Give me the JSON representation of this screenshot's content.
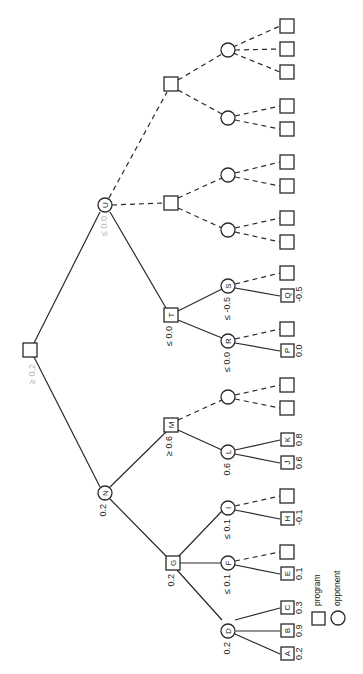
{
  "diagram": {
    "orientation": "rotated-90-clockwise",
    "legend": {
      "program_label": "program",
      "opponent_label": "opponent"
    },
    "nodes": {
      "root": {
        "label": "",
        "value": "≥ 0.2",
        "type": "program"
      },
      "U": {
        "label": "U",
        "value": "≤ 0.0",
        "type": "opponent"
      },
      "N": {
        "label": "N",
        "value": "0.2",
        "type": "opponent"
      },
      "T": {
        "label": "T",
        "value": "≤ 0.0",
        "type": "program"
      },
      "M": {
        "label": "M",
        "value": "≥ 0.6",
        "type": "program"
      },
      "G": {
        "label": "G",
        "value": "0.2",
        "type": "program"
      },
      "S": {
        "label": "S",
        "value": "≤ -0.5",
        "type": "opponent"
      },
      "R": {
        "label": "R",
        "value": "≤ 0.0",
        "type": "opponent"
      },
      "L": {
        "label": "L",
        "value": "0.6",
        "type": "opponent"
      },
      "I": {
        "label": "I",
        "value": "≤ 0.1",
        "type": "opponent"
      },
      "F": {
        "label": "F",
        "value": "≤ 0.1",
        "type": "opponent"
      },
      "D": {
        "label": "D",
        "value": "0.2",
        "type": "opponent"
      },
      "Q": {
        "label": "Q",
        "value": "-0.5",
        "type": "program"
      },
      "P": {
        "label": "P",
        "value": "0.0",
        "type": "program"
      },
      "K": {
        "label": "K",
        "value": "0.8",
        "type": "program"
      },
      "J": {
        "label": "J",
        "value": "0.6",
        "type": "program"
      },
      "H": {
        "label": "H",
        "value": "-0.1",
        "type": "program"
      },
      "E": {
        "label": "E",
        "value": "0.1",
        "type": "program"
      },
      "C": {
        "label": "C",
        "value": "0.3",
        "type": "program"
      },
      "B": {
        "label": "B",
        "value": "0.9",
        "type": "program"
      },
      "A": {
        "label": "A",
        "value": "0.2",
        "type": "program"
      }
    }
  }
}
